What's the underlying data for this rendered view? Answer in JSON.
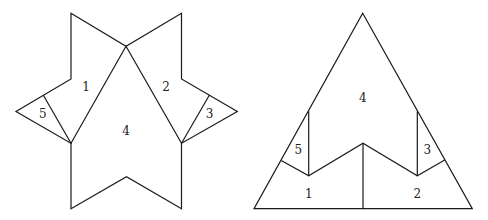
{
  "figures": [
    {
      "name": "hexagram-dissection",
      "outline": [
        [
          71,
          13.3
        ],
        [
          126,
          46.3
        ],
        [
          181.5,
          13.3
        ],
        [
          181.5,
          79
        ],
        [
          237.3,
          111.5
        ],
        [
          181.5,
          143.3
        ],
        [
          181.5,
          208.7
        ],
        [
          126.5,
          176.7
        ],
        [
          71,
          208.7
        ],
        [
          71,
          143.3
        ],
        [
          16,
          111.5
        ],
        [
          71,
          79
        ]
      ],
      "inner_lines": [
        [
          [
            126,
            46.3
          ],
          [
            71,
            143.3
          ]
        ],
        [
          [
            126,
            46.3
          ],
          [
            181.5,
            143.3
          ]
        ],
        [
          [
            43.5,
            95.5
          ],
          [
            71,
            143.3
          ]
        ],
        [
          [
            209.3,
            95.3
          ],
          [
            181.5,
            143.3
          ]
        ]
      ],
      "labels": [
        {
          "text": "1",
          "x": 86,
          "y": 87
        },
        {
          "text": "2",
          "x": 166,
          "y": 87
        },
        {
          "text": "3",
          "x": 209.5,
          "y": 114
        },
        {
          "text": "4",
          "x": 126,
          "y": 131
        },
        {
          "text": "5",
          "x": 42.7,
          "y": 114
        }
      ]
    },
    {
      "name": "triangle-assembly",
      "outline": [
        [
          362.7,
          13.3
        ],
        [
          472.3,
          208.7
        ],
        [
          254,
          208.7
        ]
      ],
      "inner_lines": [
        [
          [
            281.7,
            160.7
          ],
          [
            308.7,
            175.7
          ],
          [
            363,
            143.3
          ],
          [
            417.3,
            175.7
          ],
          [
            444.7,
            160
          ]
        ],
        [
          [
            308.7,
            111.7
          ],
          [
            308.7,
            175.7
          ]
        ],
        [
          [
            417.3,
            111.7
          ],
          [
            417.3,
            175.7
          ]
        ],
        [
          [
            363,
            143.3
          ],
          [
            363,
            208.7
          ]
        ]
      ],
      "labels": [
        {
          "text": "4",
          "x": 362.7,
          "y": 98.5
        },
        {
          "text": "5",
          "x": 298.3,
          "y": 150
        },
        {
          "text": "3",
          "x": 427.3,
          "y": 150
        },
        {
          "text": "1",
          "x": 308.7,
          "y": 194.5
        },
        {
          "text": "2",
          "x": 417.3,
          "y": 194.5
        }
      ]
    }
  ],
  "colors": {
    "stroke": "#1a1a1a",
    "label": "#222222",
    "background": "#ffffff"
  }
}
